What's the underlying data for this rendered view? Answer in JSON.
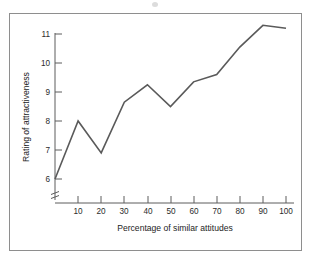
{
  "figure": {
    "frame_color": "#8e8e8e",
    "line_color": "#5a5a5a",
    "background": "#ffffff"
  },
  "chart_data": {
    "type": "line",
    "title": "",
    "xlabel": "Percentage of similar attitudes",
    "ylabel": "Rating of attractiveness",
    "x": [
      0,
      10,
      20,
      30,
      40,
      50,
      60,
      70,
      80,
      90,
      100
    ],
    "values": [
      6.0,
      8.0,
      6.9,
      8.65,
      9.25,
      8.5,
      9.35,
      9.6,
      10.55,
      11.3,
      11.2
    ],
    "xticks": [
      10,
      20,
      30,
      40,
      50,
      60,
      70,
      80,
      90,
      100
    ],
    "xtick_labels": [
      "10",
      "20",
      "30",
      "40",
      "50",
      "60",
      "70",
      "80",
      "90",
      "100"
    ],
    "yticks": [
      6,
      7,
      8,
      9,
      10,
      11
    ],
    "ytick_labels": [
      "6",
      "7",
      "8",
      "9",
      "10",
      "11"
    ],
    "xlim": [
      0,
      100
    ],
    "ylim": [
      6,
      11.45
    ],
    "grid": false,
    "legend": null,
    "y_axis_break": true,
    "series": [
      {
        "name": "Rating of attractiveness",
        "values": [
          6.0,
          8.0,
          6.9,
          8.65,
          9.25,
          8.5,
          9.35,
          9.6,
          10.55,
          11.3,
          11.2
        ]
      }
    ]
  }
}
